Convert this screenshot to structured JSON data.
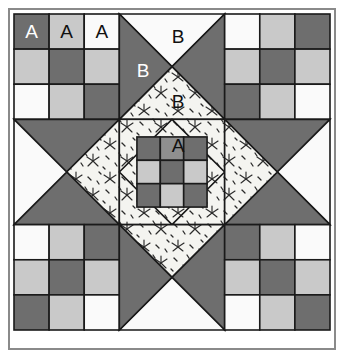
{
  "figure": {
    "kind": "quilt-block-diagram",
    "canvas": {
      "width": 344,
      "height": 358
    },
    "background": "#ffffff"
  },
  "palette": {
    "dark": "#6e6e6e",
    "medium": "#8f8f8f",
    "light": "#c9c9c9",
    "white": "#fafafa",
    "print_base": "#f4f4f0",
    "print_motif": "#2b2b2b",
    "seam": "#1a1a1a",
    "frame": "#8a8a8a",
    "label_on_dark": "#ffffff",
    "label_on_light": "#111111"
  },
  "frame": {
    "x": 8,
    "y": 8,
    "width": 328,
    "height": 342,
    "stroke": "#8a8a8a",
    "stroke_width": 2,
    "fill": "#ffffff"
  },
  "block": {
    "x": 14,
    "y": 14,
    "size": 316,
    "unit": 105.33,
    "cell": 35.11,
    "rows": 3,
    "cols": 3
  },
  "units": [
    {
      "name": "top-left-nine-patch",
      "type": "nine-patch",
      "row": 0,
      "col": 0,
      "cells": [
        "dark",
        "light",
        "white",
        "light",
        "dark",
        "light",
        "white",
        "light",
        "dark"
      ]
    },
    {
      "name": "top-center-hourglass",
      "type": "hourglass",
      "row": 0,
      "col": 1,
      "top": "white",
      "right": "dark",
      "bottom": "print",
      "left": "dark"
    },
    {
      "name": "top-right-nine-patch",
      "type": "nine-patch",
      "row": 0,
      "col": 2,
      "cells": [
        "white",
        "light",
        "dark",
        "light",
        "dark",
        "light",
        "dark",
        "light",
        "white"
      ]
    },
    {
      "name": "middle-left-hourglass",
      "type": "hourglass",
      "row": 1,
      "col": 0,
      "top": "dark",
      "right": "print",
      "bottom": "dark",
      "left": "white"
    },
    {
      "name": "center-square-in-square",
      "type": "center",
      "row": 1,
      "col": 1,
      "corner_fabric": "print",
      "cells": [
        "dark",
        "medium",
        "dark",
        "light",
        "dark",
        "light",
        "dark",
        "light",
        "dark"
      ]
    },
    {
      "name": "middle-right-hourglass",
      "type": "hourglass",
      "row": 1,
      "col": 2,
      "top": "dark",
      "right": "white",
      "bottom": "dark",
      "left": "print"
    },
    {
      "name": "bottom-left-nine-patch",
      "type": "nine-patch",
      "row": 2,
      "col": 0,
      "cells": [
        "white",
        "light",
        "dark",
        "light",
        "dark",
        "light",
        "dark",
        "light",
        "white"
      ]
    },
    {
      "name": "bottom-center-hourglass",
      "type": "hourglass",
      "row": 2,
      "col": 1,
      "top": "print",
      "right": "dark",
      "bottom": "white",
      "left": "dark"
    },
    {
      "name": "bottom-right-nine-patch",
      "type": "nine-patch",
      "row": 2,
      "col": 2,
      "cells": [
        "dark",
        "light",
        "white",
        "light",
        "dark",
        "light",
        "white",
        "light",
        "dark"
      ]
    }
  ],
  "labels": [
    {
      "id": "label-a-1",
      "text": "A",
      "x": 31.5,
      "y": 31.5,
      "on": "dark"
    },
    {
      "id": "label-a-2",
      "text": "A",
      "x": 66.7,
      "y": 31.5,
      "on": "light"
    },
    {
      "id": "label-a-3",
      "text": "A",
      "x": 101.8,
      "y": 31.5,
      "on": "light"
    },
    {
      "id": "label-b-1",
      "text": "B",
      "x": 178,
      "y": 36,
      "on": "light"
    },
    {
      "id": "label-b-2",
      "text": "B",
      "x": 143,
      "y": 70,
      "on": "dark"
    },
    {
      "id": "label-b-3",
      "text": "B",
      "x": 178,
      "y": 101,
      "on": "light"
    },
    {
      "id": "label-a-4",
      "text": "A",
      "x": 178,
      "y": 145,
      "on": "light"
    }
  ],
  "legend": {
    "a_meaning": "A",
    "b_meaning": "B"
  }
}
